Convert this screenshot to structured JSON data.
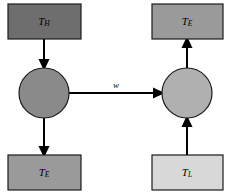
{
  "diagram": {
    "type": "block-flow-diagram",
    "title": "",
    "canvas": {
      "width": 235,
      "height": 196,
      "background": "#ffffff"
    },
    "nodes": [
      {
        "id": "reservoir-hot",
        "shape": "rectangle",
        "symbol": "T",
        "subscript": "H",
        "label": "TH",
        "fill": "#6e6e6e",
        "stroke": "#1b1b1b",
        "x": 8,
        "y": 4,
        "w": 73,
        "h": 35
      },
      {
        "id": "engine-left",
        "shape": "circle",
        "symbol": "",
        "subscript": "",
        "label": "",
        "fill": "#8a8a8a",
        "stroke": "#1b1b1b",
        "cx": 44,
        "cy": 93,
        "r": 25
      },
      {
        "id": "exhaust-left",
        "shape": "rectangle",
        "symbol": "T",
        "subscript": "E",
        "label": "TE",
        "fill": "#9a9a9a",
        "stroke": "#1b1b1b",
        "x": 8,
        "y": 155,
        "w": 73,
        "h": 35
      },
      {
        "id": "exhaust-right",
        "shape": "rectangle",
        "symbol": "T",
        "subscript": "E",
        "label": "TE",
        "fill": "#9a9a9a",
        "stroke": "#1b1b1b",
        "x": 152,
        "y": 4,
        "w": 71,
        "h": 35
      },
      {
        "id": "pump-right",
        "shape": "circle",
        "symbol": "",
        "subscript": "",
        "label": "",
        "fill": "#b0b0b0",
        "stroke": "#1b1b1b",
        "cx": 187,
        "cy": 93,
        "r": 25
      },
      {
        "id": "reservoir-cold",
        "shape": "rectangle",
        "symbol": "T",
        "subscript": "L",
        "label": "TL",
        "fill": "#d8d8d8",
        "stroke": "#1b1b1b",
        "x": 152,
        "y": 155,
        "w": 71,
        "h": 35
      }
    ],
    "edges": [
      {
        "id": "edge-hot-to-engine",
        "from": "reservoir-hot",
        "to": "engine-left",
        "direction": "down",
        "label": "",
        "x1": 44,
        "y1": 39,
        "x2": 44,
        "y2": 68
      },
      {
        "id": "edge-engine-to-exhaust",
        "from": "engine-left",
        "to": "exhaust-left",
        "direction": "down",
        "label": "",
        "x1": 44,
        "y1": 118,
        "x2": 44,
        "y2": 155
      },
      {
        "id": "edge-work",
        "from": "engine-left",
        "to": "pump-right",
        "direction": "right",
        "label": "w",
        "x1": 69,
        "y1": 93,
        "x2": 162,
        "y2": 93
      },
      {
        "id": "edge-cold-to-pump",
        "from": "reservoir-cold",
        "to": "pump-right",
        "direction": "up",
        "x1": 187,
        "y1": 155,
        "x2": 187,
        "y2": 118,
        "label": ""
      },
      {
        "id": "edge-pump-to-exhaust",
        "from": "pump-right",
        "to": "exhaust-right",
        "direction": "up",
        "x1": 187,
        "y1": 68,
        "x2": 187,
        "y2": 39,
        "label": ""
      }
    ]
  }
}
